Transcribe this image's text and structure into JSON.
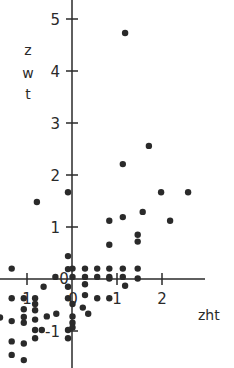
{
  "chart_data": {
    "type": "scatter",
    "title": "",
    "xlabel": "zht",
    "ylabel": "zwt",
    "xlim": [
      -1.6,
      3.5
    ],
    "ylim": [
      -1.7,
      5.3
    ],
    "grid": false,
    "legend": null,
    "x_ticks": [
      {
        "value": -1,
        "label": "1"
      },
      {
        "value": 0,
        "label": "0"
      },
      {
        "value": 1,
        "label": "1"
      },
      {
        "value": 2,
        "label": "2"
      }
    ],
    "y_ticks": [
      {
        "value": -1,
        "label": "-1"
      },
      {
        "value": 0,
        "label": "0"
      },
      {
        "value": 1,
        "label": "1"
      },
      {
        "value": 2,
        "label": "2"
      },
      {
        "value": 3,
        "label": "3"
      },
      {
        "value": 4,
        "label": "4"
      },
      {
        "value": 5,
        "label": "5"
      }
    ],
    "points": [
      [
        1.18,
        4.73
      ],
      [
        1.71,
        2.56
      ],
      [
        1.13,
        2.21
      ],
      [
        2.58,
        1.67
      ],
      [
        1.98,
        1.67
      ],
      [
        -0.09,
        1.67
      ],
      [
        -0.78,
        1.48
      ],
      [
        1.57,
        1.29
      ],
      [
        2.18,
        1.12
      ],
      [
        1.13,
        1.19
      ],
      [
        0.83,
        1.12
      ],
      [
        1.46,
        0.85
      ],
      [
        1.46,
        0.72
      ],
      [
        0.83,
        0.66
      ],
      [
        -0.09,
        0.44
      ],
      [
        -0.09,
        0.19
      ],
      [
        0.01,
        0.2
      ],
      [
        0.29,
        0.2
      ],
      [
        0.56,
        0.2
      ],
      [
        0.83,
        0.2
      ],
      [
        1.13,
        0.2
      ],
      [
        1.46,
        0.2
      ],
      [
        -1.34,
        0.2
      ],
      [
        0.01,
        0.04
      ],
      [
        0.29,
        0.04
      ],
      [
        0.56,
        0.04
      ],
      [
        0.83,
        0.04
      ],
      [
        1.13,
        0.04
      ],
      [
        -0.37,
        0.04
      ],
      [
        0.29,
        -0.1
      ],
      [
        0.83,
        0.01
      ],
      [
        1.46,
        0.01
      ],
      [
        1.18,
        -0.13
      ],
      [
        -0.63,
        -0.15
      ],
      [
        -0.09,
        -0.15
      ],
      [
        0.29,
        -0.31
      ],
      [
        -1.34,
        -0.37
      ],
      [
        -1.07,
        -0.37
      ],
      [
        -0.82,
        -0.37
      ],
      [
        -0.82,
        -0.48
      ],
      [
        -0.09,
        -0.37
      ],
      [
        0.01,
        -0.48
      ],
      [
        0.56,
        -0.37
      ],
      [
        0.83,
        -0.37
      ],
      [
        0.24,
        -0.55
      ],
      [
        0.36,
        -0.67
      ],
      [
        -1.07,
        -0.58
      ],
      [
        -0.82,
        -0.6
      ],
      [
        -0.35,
        -0.67
      ],
      [
        -0.56,
        -0.72
      ],
      [
        -1.6,
        -0.74
      ],
      [
        -1.34,
        -0.81
      ],
      [
        -1.07,
        -0.73
      ],
      [
        -1.07,
        -0.84
      ],
      [
        -0.82,
        -0.78
      ],
      [
        0.01,
        -0.72
      ],
      [
        0.01,
        -0.84
      ],
      [
        0.01,
        -0.93
      ],
      [
        -0.82,
        -0.98
      ],
      [
        -0.67,
        -0.98
      ],
      [
        -0.09,
        -0.98
      ],
      [
        -0.82,
        -1.14
      ],
      [
        -0.09,
        -1.14
      ],
      [
        -1.34,
        -1.2
      ],
      [
        -1.07,
        -1.24
      ],
      [
        -1.34,
        -1.46
      ],
      [
        -1.07,
        -1.56
      ]
    ]
  },
  "labels": {
    "y_axis_z": "z",
    "y_axis_w": "w",
    "y_axis_t": "t",
    "x_axis": "zht"
  }
}
